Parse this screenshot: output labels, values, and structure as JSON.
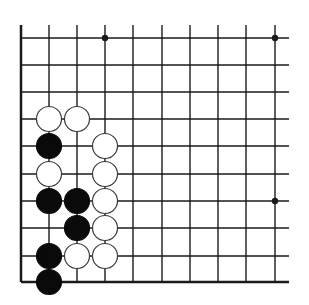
{
  "diagram": {
    "type": "go-board-corner",
    "colors": {
      "background": "#ffffff",
      "line": "#1a1a1a",
      "black_stone": "#0a0a0a",
      "white_stone": "#ffffff"
    },
    "grid": {
      "columns_x": [
        21,
        49,
        77,
        105,
        133,
        162,
        190,
        218,
        246,
        275
      ],
      "rows_y": [
        38,
        65,
        92,
        119,
        146,
        174,
        201,
        228,
        256,
        282
      ],
      "open_top_y": 25,
      "open_right_x": 289
    },
    "star_points": [
      {
        "col": 3,
        "row": 0
      },
      {
        "col": 9,
        "row": 0
      },
      {
        "col": 9,
        "row": 6
      }
    ],
    "stones": [
      {
        "color": "white",
        "col": 1,
        "row": 3
      },
      {
        "color": "white",
        "col": 2,
        "row": 3
      },
      {
        "color": "black",
        "col": 1,
        "row": 4
      },
      {
        "color": "white",
        "col": 3,
        "row": 4
      },
      {
        "color": "white",
        "col": 1,
        "row": 5
      },
      {
        "color": "white",
        "col": 3,
        "row": 5
      },
      {
        "color": "black",
        "col": 1,
        "row": 6
      },
      {
        "color": "black",
        "col": 2,
        "row": 6
      },
      {
        "color": "white",
        "col": 3,
        "row": 6
      },
      {
        "color": "black",
        "col": 2,
        "row": 7
      },
      {
        "color": "white",
        "col": 3,
        "row": 7
      },
      {
        "color": "black",
        "col": 1,
        "row": 8
      },
      {
        "color": "white",
        "col": 2,
        "row": 8
      },
      {
        "color": "white",
        "col": 3,
        "row": 8
      },
      {
        "color": "black",
        "col": 1,
        "row": 9
      }
    ]
  }
}
